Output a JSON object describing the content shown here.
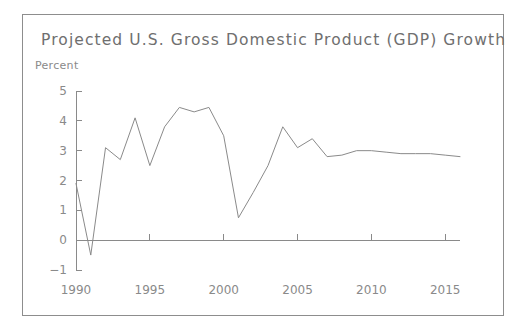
{
  "card": {
    "title": "Projected U.S. Gross Domestic Product (GDP) Growth",
    "unit_label": "Percent",
    "border_color": "#8d8d8d",
    "background": "#ffffff"
  },
  "chart_data": {
    "type": "line",
    "title": "Projected U.S. Gross Domestic Product (GDP) Growth",
    "subtitle": "",
    "xlabel": "",
    "ylabel": "Percent",
    "xlim": [
      1990,
      2016
    ],
    "ylim": [
      -1,
      5
    ],
    "xticks": [
      1990,
      1995,
      2000,
      2005,
      2010,
      2015
    ],
    "xtick_labels": [
      "1990",
      "1995",
      "2000",
      "2005",
      "2010",
      "2015"
    ],
    "yticks": [
      -1,
      0,
      1,
      2,
      3,
      4,
      5
    ],
    "ytick_labels": [
      "−1",
      "0",
      "1",
      "2",
      "3",
      "4",
      "5"
    ],
    "grid": false,
    "legend": false,
    "zero_line": true,
    "line_color": "#8a8a8a",
    "axis_color": "#8a8a8a",
    "x": [
      1990,
      1991,
      1992,
      1993,
      1994,
      1995,
      1996,
      1997,
      1998,
      1999,
      2000,
      2001,
      2002,
      2003,
      2004,
      2005,
      2006,
      2007,
      2008,
      2009,
      2010,
      2011,
      2012,
      2013,
      2014,
      2015,
      2016
    ],
    "values": [
      1.9,
      -0.5,
      3.1,
      2.7,
      4.1,
      2.5,
      3.8,
      4.45,
      4.3,
      4.45,
      3.5,
      0.75,
      1.6,
      2.5,
      3.8,
      3.1,
      3.4,
      2.8,
      2.85,
      3.0,
      3.0,
      2.95,
      2.9,
      2.9,
      2.9,
      2.85,
      2.8
    ],
    "series": [
      {
        "name": "GDP growth",
        "values": [
          1.9,
          -0.5,
          3.1,
          2.7,
          4.1,
          2.5,
          3.8,
          4.45,
          4.3,
          4.45,
          3.5,
          0.75,
          1.6,
          2.5,
          3.8,
          3.1,
          3.4,
          2.8,
          2.85,
          3.0,
          3.0,
          2.95,
          2.9,
          2.9,
          2.9,
          2.85,
          2.8
        ]
      }
    ]
  }
}
